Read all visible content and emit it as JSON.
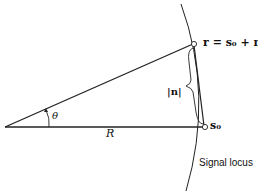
{
  "diagram": {
    "labels": {
      "r_point": "r = s₀ + n",
      "s0_point": "s₀",
      "noise_magnitude": "|n|",
      "angle": "θ",
      "radius": "R",
      "signal_locus": "Signal locus"
    },
    "colors": {
      "line": "#222222",
      "background": "#ffffff"
    }
  }
}
